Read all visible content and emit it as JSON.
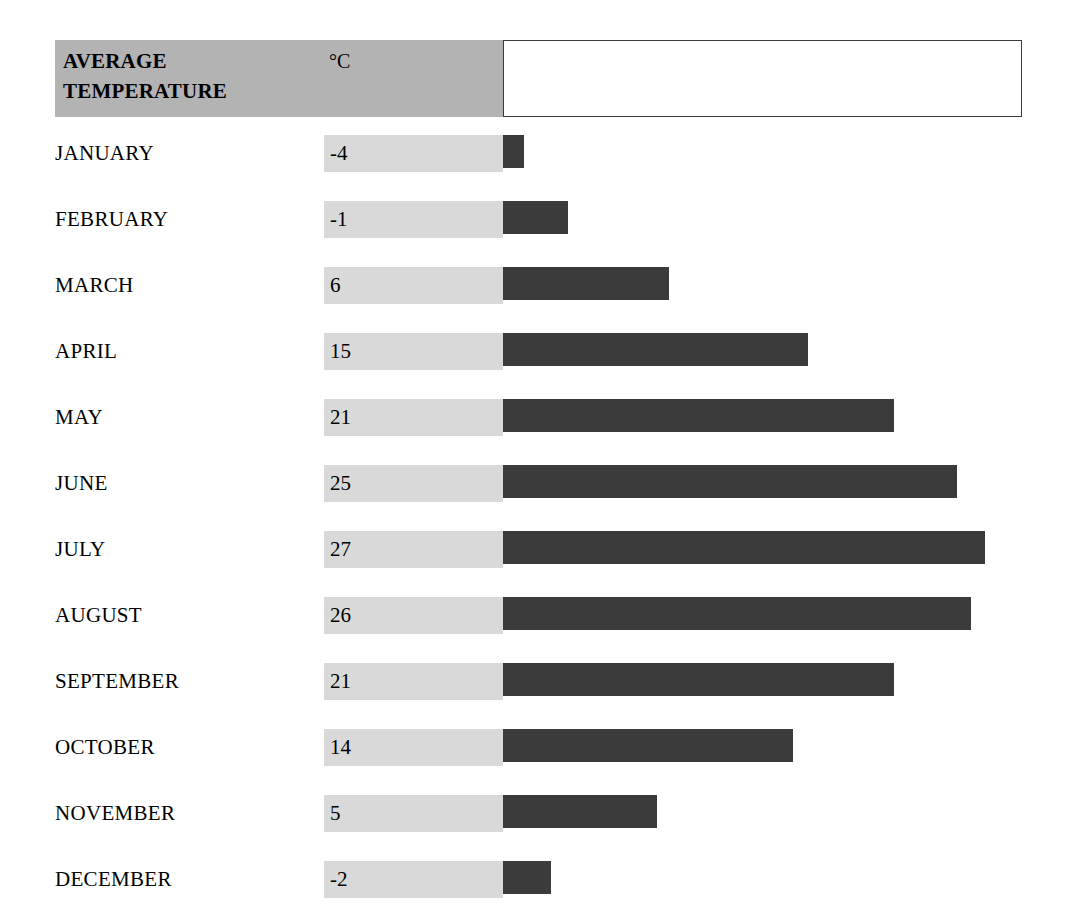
{
  "header": {
    "title": "AVERAGE\nTEMPERATURE",
    "unit": "°C",
    "value_box_text": ""
  },
  "colors": {
    "header_band": "#b3b3b3",
    "value_cell": "#d9d9d9",
    "bar": "#3b3b3b",
    "box_border": "#3c3c3c",
    "background": "#ffffff",
    "text": "#000000"
  },
  "rows": [
    {
      "month": "JANUARY",
      "value": "-4",
      "bar_px": 21
    },
    {
      "month": "FEBRUARY",
      "value": "-1",
      "bar_px": 65
    },
    {
      "month": "MARCH",
      "value": "6",
      "bar_px": 166
    },
    {
      "month": "APRIL",
      "value": "15",
      "bar_px": 305
    },
    {
      "month": "MAY",
      "value": "21",
      "bar_px": 391
    },
    {
      "month": "JUNE",
      "value": "25",
      "bar_px": 454
    },
    {
      "month": "JULY",
      "value": "27",
      "bar_px": 482
    },
    {
      "month": "AUGUST",
      "value": "26",
      "bar_px": 468
    },
    {
      "month": "SEPTEMBER",
      "value": "21",
      "bar_px": 391
    },
    {
      "month": "OCTOBER",
      "value": "14",
      "bar_px": 290
    },
    {
      "month": "NOVEMBER",
      "value": "5",
      "bar_px": 154
    },
    {
      "month": "DECEMBER",
      "value": "-2",
      "bar_px": 48
    }
  ],
  "chart_data": {
    "type": "bar",
    "title": "AVERAGE TEMPERATURE",
    "subtitle": "",
    "orientation": "horizontal",
    "xlabel": "",
    "ylabel": "",
    "unit": "°C",
    "categories": [
      "JANUARY",
      "FEBRUARY",
      "MARCH",
      "APRIL",
      "MAY",
      "JUNE",
      "JULY",
      "AUGUST",
      "SEPTEMBER",
      "OCTOBER",
      "NOVEMBER",
      "DECEMBER"
    ],
    "values": [
      -4,
      -1,
      6,
      15,
      21,
      25,
      27,
      26,
      21,
      14,
      5,
      -2
    ],
    "value_labels": [
      "-4",
      "-1",
      "6",
      "15",
      "21",
      "25",
      "27",
      "26",
      "21",
      "14",
      "5",
      "-2"
    ],
    "xlim": [
      -4,
      27
    ],
    "grid": false,
    "legend": null,
    "annotations": []
  }
}
